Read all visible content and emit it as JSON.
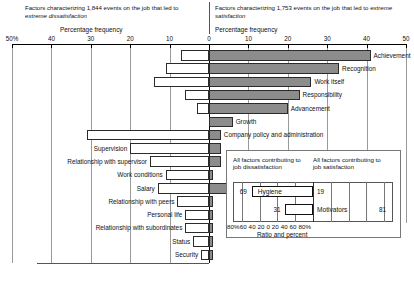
{
  "header": {
    "left_title_pre": "Factors characterizing 1,844 events on the job that led to ",
    "left_title_em": "extreme dissatisfaction",
    "right_title_pre": "Factors characterizing 1,753 events on the job that led to ",
    "right_title_em": "extreme satisfaction",
    "left_axis_label": "Percentage frequency",
    "right_axis_label": "Percentage frequency"
  },
  "axis": {
    "left_ticks": [
      "50%",
      "40",
      "30",
      "20",
      "10",
      "0"
    ],
    "right_ticks": [
      "0",
      "10",
      "20",
      "30",
      "40",
      "50"
    ],
    "left_tick_values": [
      50,
      40,
      30,
      20,
      10,
      0
    ],
    "right_tick_values": [
      0,
      10,
      20,
      30,
      40,
      50
    ],
    "max": 50
  },
  "chart_data": {
    "type": "bar",
    "xlabel": "Percentage frequency",
    "ylabel": "",
    "orientation": "horizontal",
    "style": "diverging bidirectional bar (tornado)",
    "xlim": [
      -50,
      50
    ],
    "grid": true,
    "legend": "inset ratio panel",
    "categories": [
      "Achievement",
      "Recognition",
      "Work itself",
      "Responsibility",
      "Advancement",
      "Growth",
      "Company policy and administration",
      "Supervision",
      "Relationship with supervisor",
      "Work conditions",
      "Salary",
      "Relationship with peers",
      "Personal life",
      "Relationship with subordinates",
      "Status",
      "Security"
    ],
    "series": [
      {
        "name": "Factors leading to extreme satisfaction",
        "color": "#8c8c8c",
        "side": "right",
        "values": [
          41,
          33,
          26,
          23,
          20,
          6,
          3,
          3,
          3,
          1,
          5,
          1,
          1,
          1,
          1,
          1
        ]
      },
      {
        "name": "Factors leading to extreme dissatisfaction",
        "color": "#ffffff",
        "side": "left",
        "values": [
          7,
          11,
          14,
          6,
          3,
          0,
          31,
          20,
          15,
          11,
          13,
          8,
          6,
          6,
          4,
          2
        ]
      }
    ]
  },
  "inset": {
    "caption_left": "All factors contributing to job dissatisfaction",
    "caption_right": "All factors contributing to job satisfaction",
    "rows": [
      {
        "label": "Hygiene",
        "left_value": 69,
        "right_value": 19
      },
      {
        "label": "Motivators",
        "left_value": 31,
        "right_value": 81
      }
    ],
    "axis_ticks": [
      "80%",
      "60",
      "40",
      "20",
      "0",
      "20",
      "40",
      "60",
      "80%"
    ],
    "axis_label_text": "80%60 40 20  0  20 40 60 80%",
    "axis_title": "Ratio and percent"
  }
}
